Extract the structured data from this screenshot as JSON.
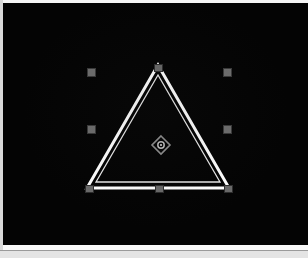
{
  "app": {
    "title": "3D Viewport",
    "mode": "Object Select",
    "background_color": "#040404",
    "frame_color": "#fafafa"
  },
  "viewport": {
    "width": 305,
    "height": 242,
    "offset_x": 3,
    "offset_y": 3,
    "label": "viewport-canvas"
  },
  "shape": {
    "name": "Triangle",
    "type": "triangle",
    "state": "selected",
    "stroke_color": "#ffffff",
    "inner_stroke_color": "#e8e8e8",
    "fill": "none",
    "outer_stroke_width": 3,
    "inner_stroke_width": 1.3,
    "vertices": [
      {
        "id": "apex",
        "label": "Apex",
        "x": 155,
        "y": 62
      },
      {
        "id": "bottom-left",
        "label": "Bottom Left",
        "x": 84,
        "y": 185
      },
      {
        "id": "bottom-right",
        "label": "Bottom Right",
        "x": 226,
        "y": 185
      }
    ],
    "inner_vertices": [
      {
        "x": 155,
        "y": 72
      },
      {
        "x": 93,
        "y": 179
      },
      {
        "x": 217,
        "y": 179
      }
    ]
  },
  "handles": {
    "color": "#6e6e6e",
    "border_color": "#3a3a3a",
    "size": 9,
    "vertex_handles": [
      {
        "id": "handle-apex",
        "label": "Apex Handle",
        "x": 155,
        "y": 65
      },
      {
        "id": "handle-bottom-left",
        "label": "Bottom Left Handle",
        "x": 86,
        "y": 186
      },
      {
        "id": "handle-bottom-middle",
        "label": "Bottom Middle Handle",
        "x": 156,
        "y": 186
      },
      {
        "id": "handle-bottom-right",
        "label": "Bottom Right Handle",
        "x": 225,
        "y": 186
      }
    ],
    "bounding_grips": [
      {
        "id": "grip-top-left",
        "label": "Top Left Grip",
        "x": 88,
        "y": 69
      },
      {
        "id": "grip-top-right",
        "label": "Top Right Grip",
        "x": 224,
        "y": 69
      },
      {
        "id": "grip-bottom-left",
        "label": "Bottom Left Grip",
        "x": 88,
        "y": 126
      },
      {
        "id": "grip-bottom-right",
        "label": "Bottom Right Grip",
        "x": 224,
        "y": 126
      }
    ]
  },
  "pivot": {
    "id": "pivot-marker",
    "label": "Rotation Pivot",
    "x": 158,
    "y": 142,
    "color": "#9a9a9a",
    "shape": "diamond-with-center-dot"
  }
}
